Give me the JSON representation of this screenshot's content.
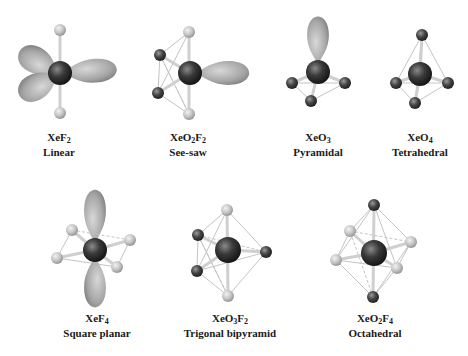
{
  "figure": {
    "background": "#ffffff",
    "colors": {
      "xenon": "#2a2a2a",
      "oxygen": "#3a3a3a",
      "fluorine": "#bdbdbd",
      "lone_pair": "#a8a8a8",
      "bond": "#c8c8c8"
    },
    "molecules": [
      {
        "id": "xef2",
        "formula_parts": [
          "XeF",
          "2"
        ],
        "geometry": "Linear",
        "label_x": 59,
        "label_y": 130
      },
      {
        "id": "xeo2f2",
        "formula_parts": [
          "XeO",
          "2",
          "F",
          "2"
        ],
        "geometry": "See-saw",
        "label_x": 188,
        "label_y": 130
      },
      {
        "id": "xeo3",
        "formula_parts": [
          "XeO",
          "3"
        ],
        "geometry": "Pyramidal",
        "label_x": 318,
        "label_y": 130
      },
      {
        "id": "xeo4",
        "formula_parts": [
          "XeO",
          "4"
        ],
        "geometry": "Tetrahedral",
        "label_x": 420,
        "label_y": 130
      },
      {
        "id": "xef4",
        "formula_parts": [
          "XeF",
          "4"
        ],
        "geometry": "Square planar",
        "label_x": 97,
        "label_y": 311
      },
      {
        "id": "xeo3f2",
        "formula_parts": [
          "XeO",
          "3",
          "F",
          "2"
        ],
        "geometry": "Trigonal bipyramid",
        "label_x": 230,
        "label_y": 311
      },
      {
        "id": "xeo2f4",
        "formula_parts": [
          "XeO",
          "2",
          "F",
          "4"
        ],
        "geometry": "Octahedral",
        "label_x": 375,
        "label_y": 311
      }
    ]
  }
}
